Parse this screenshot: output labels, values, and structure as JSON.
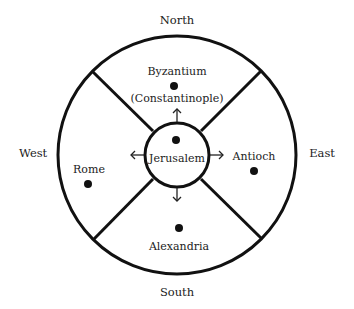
{
  "diagram": {
    "title": "",
    "colors": {
      "stroke": "#111111",
      "text": "#222222",
      "background": "#ffffff"
    },
    "directions": {
      "north": "North",
      "south": "South",
      "east": "East",
      "west": "West"
    },
    "center": {
      "label": "Jerusalem",
      "marker": "dot"
    },
    "cities": [
      {
        "id": "byzantium",
        "line1": "Byzantium",
        "line2": "(Constantinople)",
        "direction": "north"
      },
      {
        "id": "antioch",
        "line1": "Antioch",
        "direction": "east"
      },
      {
        "id": "alexandria",
        "line1": "Alexandria",
        "direction": "south"
      },
      {
        "id": "rome",
        "line1": "Rome",
        "direction": "west"
      }
    ],
    "arrows": [
      "up",
      "right",
      "down",
      "left"
    ]
  }
}
